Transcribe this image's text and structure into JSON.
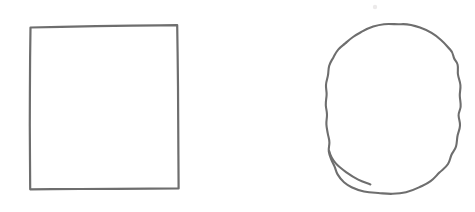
{
  "canvas": {
    "width": 475,
    "height": 212,
    "background_color": "#ffffff",
    "title": "Two hand-drawn outline shapes"
  },
  "style": {
    "stroke_color": "#6e6e6e",
    "stroke_color_soft": "#7b7b7b",
    "stroke_width": 2.1,
    "fill": "none"
  },
  "shapes": [
    {
      "id": "square",
      "name": "hand-drawn-rectangle",
      "type": "rectangle",
      "label": "Rectangle",
      "stroke_color": "#6e6e6e",
      "stroke_width": 2.2,
      "fill": "none",
      "bbox": {
        "x": 29,
        "y": 25,
        "width": 150,
        "height": 164
      },
      "path": "M30.5,27.5 L61,26.8 L96,26.2 L132,25.6 L160,25.3 L177.2,25.1 L177.6,52 L178,86 L178.2,120 L178.4,155 L178.6,188.4 L150,188.6 L115,188.8 L80,189 L52,189.2 L30.2,189.3 L30.0,160 L29.8,126 L29.9,92 L30.1,58 L30.5,27.5 Z"
    },
    {
      "id": "blob",
      "name": "hand-drawn-blob",
      "type": "closed-freeform",
      "label": "Irregular rounded blob",
      "stroke_color": "#6e6e6e",
      "stroke_width": 2.1,
      "fill": "none",
      "bbox": {
        "x": 325,
        "y": 23,
        "width": 136,
        "height": 171
      },
      "path": "M384,24.2 C391,23.6 396,24.6 401,24.2 C409,23.6 414,25.4 420,27.6 C428,30.4 435,34.6 441,40.0 C446,44.4 448,47.6 450,49.4 C453,52.0 453,55.4 454,58.0 C455,60.6 457,61.8 457.6,64.6 C458.4,68.2 457.4,71.0 458.0,74.6 C458.6,78.4 460,81.0 460.4,85.0 C460.8,89.0 459.6,92.0 459.8,96.0 C460.0,100.5 461.0,103.0 460.6,107.0 C460.2,110.5 458.4,112.0 458.6,115.5 C458.8,119.5 460.2,121.5 460.0,125.5 C459.8,130.0 458.0,132.5 457.4,136.5 C456.8,140.5 457.0,143.0 456.0,146.5 C455.0,150.0 453.0,151.5 451.6,154.5 C450.0,158.0 450.2,160.5 448.0,164.0 C445.6,167.8 442.6,169.4 439.4,172.6 C436.0,176.0 434.4,178.4 430.6,181.2 C426.6,184.2 423.6,185.2 419.0,187.4 C414.0,189.8 411.2,191.0 406.0,192.2 C401.0,193.4 397.8,193.6 392.6,193.8 C387.0,194.0 383.8,193.4 378.2,193.0 C372.6,192.6 369.4,192.6 364.0,191.4 C359.0,190.3 356.2,189.4 351.6,187.2 C348.2,185.6 346.6,184.4 344.0,182.2 C341.0,179.6 339.6,177.8 337.6,174.4 C336.0,171.6 335.8,169.6 334.6,166.6 C333.4,163.6 332.4,162.4 331.2,159.4 C330.0,156.4 329.2,154.6 328.8,151.4 C328.4,148.0 329.4,146.0 329.4,142.6 C329.4,139.0 328.4,137.2 327.8,133.6 C327.2,130.0 326.6,128.0 326.4,124.4 C326.2,120.6 327.0,118.6 327.0,114.8 C327.0,111.0 326.0,109.0 325.8,105.2 C325.6,101.2 326.4,99.0 326.6,95.0 C326.8,91.0 325.8,89.0 326.0,85.0 C326.2,81.0 327.4,79.0 328.0,75.2 C328.6,71.4 328.2,69.4 329.2,65.8 C330.2,62.2 331.6,60.6 333.4,57.4 C335.2,54.2 335.8,52.4 338.2,49.6 C340.6,46.8 342.4,45.8 345.2,43.4 C348.2,40.8 349.6,39.4 353.0,37.0 C356.6,34.4 358.8,33.4 362.8,31.2 C366.8,29.0 369.0,28.0 373.2,26.6 C377.4,25.2 380.0,24.6 384,24.2 Z"
    },
    {
      "id": "blob-notch",
      "name": "blob-lower-left-notch",
      "type": "detail-stroke",
      "label": "Lower-left notch",
      "stroke_color": "#6e6e6e",
      "stroke_width": 2.1,
      "fill": "none",
      "path": "M329.2,151.0 C330.4,156.0 332.4,159.6 335.8,163.4 C339.2,167.2 342.4,169.4 346.8,172.6 C351.0,175.6 353.4,177.2 358.2,179.6 C362.6,181.8 365.6,182.6 370.4,184.4"
    }
  ],
  "marks": [
    {
      "id": "speck-1",
      "name": "faint-speck",
      "label": "Faint paper speck",
      "color": "#ececec",
      "x": 375,
      "y": 7,
      "r": 2.2
    }
  ]
}
